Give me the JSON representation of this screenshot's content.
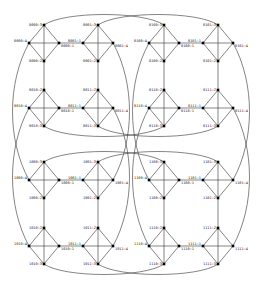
{
  "diagram": {
    "type": "graph",
    "colors": {
      "background": "#ffffff",
      "edge": "#333333",
      "node": "#000000",
      "label": "#222222"
    },
    "clusters": [
      {
        "id": "0000",
        "cx": 44,
        "cy": 43,
        "row": 0,
        "col": 0
      },
      {
        "id": "0001",
        "cx": 98,
        "cy": 43,
        "row": 0,
        "col": 1
      },
      {
        "id": "0100",
        "cx": 164,
        "cy": 43,
        "row": 0,
        "col": 2
      },
      {
        "id": "0101",
        "cx": 218,
        "cy": 43,
        "row": 0,
        "col": 3
      },
      {
        "id": "0010",
        "cx": 44,
        "cy": 108,
        "row": 1,
        "col": 0
      },
      {
        "id": "0011",
        "cx": 98,
        "cy": 108,
        "row": 1,
        "col": 1
      },
      {
        "id": "0110",
        "cx": 164,
        "cy": 108,
        "row": 1,
        "col": 2
      },
      {
        "id": "0111",
        "cx": 218,
        "cy": 108,
        "row": 1,
        "col": 3
      },
      {
        "id": "1000",
        "cx": 44,
        "cy": 180,
        "row": 2,
        "col": 0
      },
      {
        "id": "1001",
        "cx": 98,
        "cy": 180,
        "row": 2,
        "col": 1
      },
      {
        "id": "1100",
        "cx": 164,
        "cy": 180,
        "row": 2,
        "col": 2
      },
      {
        "id": "1101",
        "cx": 218,
        "cy": 180,
        "row": 2,
        "col": 3
      },
      {
        "id": "1010",
        "cx": 44,
        "cy": 246,
        "row": 3,
        "col": 0
      },
      {
        "id": "1011",
        "cx": 98,
        "cy": 246,
        "row": 3,
        "col": 1
      },
      {
        "id": "1110",
        "cx": 164,
        "cy": 246,
        "row": 3,
        "col": 2
      },
      {
        "id": "1111",
        "cx": 218,
        "cy": 246,
        "row": 3,
        "col": 3
      }
    ],
    "node_labels": {
      "0000": {
        "top": "0000:3",
        "left": "0000:4",
        "right": "0000:1",
        "bottom": "0000:2"
      },
      "0001": {
        "top": "0001:3",
        "left": "0001:1",
        "right": "0001:4",
        "bottom": "0001:2"
      },
      "0100": {
        "top": "0100:3",
        "left": "0100:4",
        "right": "0100:1",
        "bottom": "0100:2"
      },
      "0101": {
        "top": "0101:3",
        "left": "0101:1",
        "right": "0101:4",
        "bottom": "0101:2"
      },
      "0010": {
        "top": "0010:2",
        "left": "0010:4",
        "right": "0010:1",
        "bottom": "0010:3"
      },
      "0011": {
        "top": "0011:2",
        "left": "0011:1",
        "right": "0011:4",
        "bottom": "0011:3"
      },
      "0110": {
        "top": "0110:2",
        "left": "0110:4",
        "right": "0110:1",
        "bottom": "0110:3"
      },
      "0111": {
        "top": "0111:2",
        "left": "0111:1",
        "right": "0111:4",
        "bottom": "0111:3"
      },
      "1000": {
        "top": "1000:3",
        "left": "1000:4",
        "right": "1000:1",
        "bottom": "1000:2"
      },
      "1001": {
        "top": "1001:3",
        "left": "1001:1",
        "right": "1001:4",
        "bottom": "1001:2"
      },
      "1100": {
        "top": "1100:3",
        "left": "1100:4",
        "right": "1100:1",
        "bottom": "1100:2"
      },
      "1101": {
        "top": "1101:3",
        "left": "1101:1",
        "right": "1101:4",
        "bottom": "1101:2"
      },
      "1010": {
        "top": "1010:2",
        "left": "1010:4",
        "right": "1010:1",
        "bottom": "1010:3"
      },
      "1011": {
        "top": "1011:2",
        "left": "1011:1",
        "right": "1011:4",
        "bottom": "1011:3"
      },
      "1110": {
        "top": "1110:2",
        "left": "1110:4",
        "right": "1110:1",
        "bottom": "1110:3"
      },
      "1111": {
        "top": "1111:2",
        "left": "1111:1",
        "right": "1111:4",
        "bottom": "1111:3"
      }
    },
    "bridges": [
      [
        "0000:1",
        "0001:1"
      ],
      [
        "0100:1",
        "0101:1"
      ],
      [
        "0010:1",
        "0011:1"
      ],
      [
        "0110:1",
        "0111:1"
      ],
      [
        "1000:1",
        "1001:1"
      ],
      [
        "1100:1",
        "1101:1"
      ],
      [
        "1010:1",
        "1011:1"
      ],
      [
        "1110:1",
        "1111:1"
      ],
      [
        "0000:2",
        "0010:2"
      ],
      [
        "0001:2",
        "0011:2"
      ],
      [
        "0100:2",
        "0110:2"
      ],
      [
        "0101:2",
        "0111:2"
      ],
      [
        "1000:2",
        "1010:2"
      ],
      [
        "1001:2",
        "1011:2"
      ],
      [
        "1100:2",
        "1110:2"
      ],
      [
        "1101:2",
        "1111:2"
      ]
    ],
    "arcs": [
      [
        "0000:3",
        "0100:3"
      ],
      [
        "0001:3",
        "0101:3"
      ],
      [
        "0010:3",
        "0110:3"
      ],
      [
        "0011:3",
        "0111:3"
      ],
      [
        "1000:3",
        "1100:3"
      ],
      [
        "1001:3",
        "1101:3"
      ],
      [
        "1010:3",
        "1110:3"
      ],
      [
        "1011:3",
        "1111:3"
      ],
      [
        "0000:4",
        "1000:4"
      ],
      [
        "0010:4",
        "1010:4"
      ],
      [
        "0001:4",
        "1001:4"
      ],
      [
        "0011:4",
        "1011:4"
      ],
      [
        "0100:4",
        "1100:4"
      ],
      [
        "0110:4",
        "1110:4"
      ],
      [
        "0101:4",
        "1101:4"
      ],
      [
        "0111:4",
        "1111:4"
      ]
    ]
  }
}
